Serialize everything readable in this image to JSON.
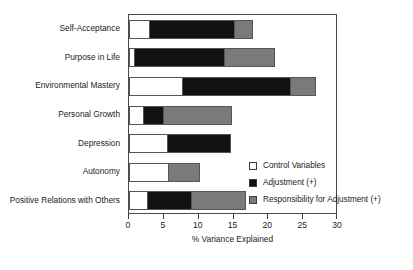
{
  "chart_data": {
    "type": "bar",
    "orientation": "horizontal",
    "stacked": true,
    "title": "",
    "xlabel": "% Variance Explained",
    "ylabel": "",
    "xlim": [
      0,
      30
    ],
    "xticks": [
      0,
      5,
      10,
      15,
      20,
      25,
      30
    ],
    "xtick_labels": [
      "0",
      "5",
      "10",
      "15",
      "20",
      "25",
      "30"
    ],
    "grid": false,
    "legend_position": "inside-lower-right",
    "categories": [
      "Self-Acceptance",
      "Purpose in Life",
      "Environmental Mastery",
      "Personal Growth",
      "Depression",
      "Autonomy",
      "Positive Relations with Others"
    ],
    "series": [
      {
        "name": "Control Variables",
        "color": "#ffffff",
        "values": [
          2.7,
          0.6,
          7.5,
          1.9,
          5.3,
          5.4,
          2.5
        ]
      },
      {
        "name": "Adjustment (+)",
        "color": "#111111",
        "values": [
          12.2,
          12.9,
          15.4,
          2.8,
          9.0,
          0.0,
          6.3
        ]
      },
      {
        "name": "Responsibility for Adjustment (+)",
        "color": "#7a7a7a",
        "values": [
          2.6,
          7.2,
          3.6,
          9.8,
          0.0,
          4.5,
          7.7
        ]
      }
    ],
    "totals": [
      17.5,
      20.7,
      26.5,
      14.5,
      14.3,
      9.9,
      16.5
    ]
  },
  "legend": {
    "items": [
      {
        "label": "Control Variables",
        "color": "#ffffff"
      },
      {
        "label": "Adjustment (+)",
        "color": "#111111"
      },
      {
        "label": "Responsibility for Adjustment (+)",
        "color": "#7a7a7a"
      }
    ]
  },
  "axis": {
    "x_title": "% Variance Explained"
  },
  "colors": {
    "control": "#ffffff",
    "adjustment": "#111111",
    "responsibility": "#7a7a7a",
    "frame": "#4a4a4a",
    "text": "#1b1b1b"
  }
}
